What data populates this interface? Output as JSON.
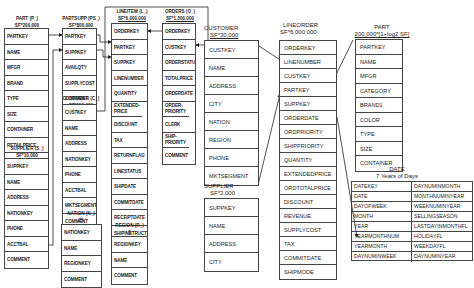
{
  "left_schema": {
    "part": {
      "title": "PART (P_)",
      "card": "SF*200,000",
      "fields": [
        "PARTKEY",
        "NAME",
        "MFGR",
        "BRAND",
        "TYPE",
        "SIZE",
        "CONTAINER",
        "RETAILPRICE",
        "COMMENT"
      ]
    },
    "partsupp": {
      "title": "PARTSUPP (PS_)",
      "card": "SF*800,000",
      "fields": [
        "PARTKEY",
        "SUPPKEY",
        "AVAILQTY",
        "SUPPLYCOST",
        "COMMENT"
      ]
    },
    "lineitem": {
      "title": "LINEITEM (L_)",
      "card": "SF*6,000,000",
      "fields": [
        "ORDERKEY",
        "PARTKEY",
        "SUPPKEY",
        "LINENUMBER",
        "QUANTITY",
        "EXTENDED-PRICE",
        "DISCOUNT",
        "TAX",
        "RETURNFLAG",
        "LINESTATUS",
        "SHIPDATE",
        "COMMITDATE",
        "RECEIPTDATE",
        "SHIPINSTRUCT",
        "SHIPMODE",
        "COMMENT"
      ]
    },
    "orders": {
      "title": "ORDERS (O_)",
      "card": "SF*1,500,000",
      "fields": [
        "ORDERKEY",
        "CUSTKEY",
        "ORDERSTATUS",
        "TOTALPRICE",
        "ORDERDATE",
        "ORDER-PRIORITY",
        "CLERK",
        "SHIP-PRIORITY",
        "COMMENT"
      ]
    },
    "customer": {
      "title": "CUSTOMER (C_)",
      "card": "SF*150,000",
      "fields": [
        "CUSTKEY",
        "NAME",
        "ADDRESS",
        "NATIONKEY",
        "PHONE",
        "ACCTBAL",
        "MKTSEGMENT",
        "COMMENT"
      ]
    },
    "supplier": {
      "title": "SUPPLIER (S_)",
      "card": "SF*10,000",
      "fields": [
        "SUPPKEY",
        "NAME",
        "ADDRESS",
        "NATIONKEY",
        "PHONE",
        "ACCTBAL",
        "COMMENT"
      ]
    },
    "nation": {
      "title": "NATION (N_)",
      "card": "25",
      "fields": [
        "NATIONKEY",
        "NAME",
        "REGIONKEY",
        "COMMENT"
      ]
    },
    "region": {
      "title": "REGION (R_)",
      "card": "5",
      "fields": [
        "REGIONKEY",
        "NAME",
        "COMMENT"
      ]
    }
  },
  "star_schema": {
    "customer": {
      "title": "CUSTOMER",
      "card": "SF*30,000",
      "fields": [
        "CUSTKEY",
        "NAME",
        "ADDRESS",
        "CITY",
        "NATION",
        "REGION",
        "PHONE",
        "MKTSEGMENT"
      ]
    },
    "supplier": {
      "title": "SUPPLIER",
      "card": "SF*2,000",
      "fields": [
        "SUPPKEY",
        "NAME",
        "ADDRESS",
        "CITY",
        "NATION",
        "REGION",
        "PHONE"
      ]
    },
    "lineorder": {
      "title": "LINEORDER",
      "card": "SF*6,000,000",
      "fields": [
        "ORDERKEY",
        "LINENUMBER",
        "CUSTKEY",
        "PARTKEY",
        "SUPPKEY",
        "ORDERDATE",
        "ORDPRIORITY",
        "SHIPPRIORITY",
        "QUANTITY",
        "EXTENDEDPRICE",
        "ORDTOTALPRICE",
        "DISCOUNT",
        "REVENUE",
        "SUPPLYCOST",
        "TAX",
        "COMMITDATE",
        "SHIPMODE"
      ]
    },
    "part": {
      "title": "PART",
      "card": "200,000*[1+log2 SF]",
      "fields": [
        "PARTKEY",
        "NAME",
        "MFGR",
        "CATEGORY",
        "BRAND1",
        "COLOR",
        "TYPE",
        "SIZE",
        "CONTAINER"
      ]
    },
    "date": {
      "title": "DATE",
      "card": "7 Years of Days",
      "rows": [
        [
          "DATEKEY",
          "DAYNUMINMONTH"
        ],
        [
          "DATE",
          "MONTHNUMINYEAR"
        ],
        [
          "DAYOFWEEK",
          "WEEKNUMINYEAR"
        ],
        [
          "MONTH",
          "SELLINGSEASON"
        ],
        [
          "YEAR",
          "LASTDAYINMONTHFL"
        ],
        [
          "YEARMONTHNUM",
          "HOLIDAYFL"
        ],
        [
          "YEARMONTH",
          "WEEKDAYFL"
        ],
        [
          "DAYNUMINWEEK",
          "DAYNUMINYEAR"
        ]
      ]
    }
  }
}
